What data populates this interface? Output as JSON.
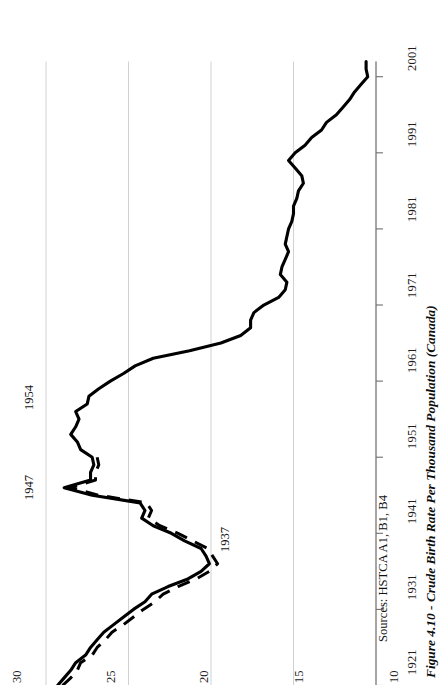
{
  "figure": {
    "caption": "Figure 4.10 - Crude Birth Rate Per Thousand Population (Canada)",
    "sources": "Sources: HSTCA A1, B1, B4"
  },
  "annotations": [
    {
      "id": "peak-1947",
      "label": "1947"
    },
    {
      "id": "peak-1954",
      "label": "1954"
    },
    {
      "id": "trough-1937",
      "label": "1937"
    }
  ],
  "axis": {
    "x_tick_labels": [
      "1921",
      "1931",
      "1941",
      "1951",
      "1961",
      "1971",
      "1981",
      "1991",
      "2001"
    ],
    "y_tick_labels": [
      "30",
      "25",
      "20",
      "15",
      "10"
    ]
  },
  "chart_data": {
    "type": "line",
    "title": "Figure 4.10 - Crude Birth Rate Per Thousand Population (Canada)",
    "xlabel": "",
    "ylabel": "",
    "xlim": [
      1921,
      2003
    ],
    "ylim": [
      10,
      30
    ],
    "grid": true,
    "legend": "none",
    "orientation": "rotated-90ccw",
    "xticks": [
      1921,
      1931,
      1941,
      1951,
      1961,
      1971,
      1981,
      1991,
      2001
    ],
    "yticks": [
      10,
      15,
      20,
      25,
      30
    ],
    "annotations": [
      {
        "label": "1947",
        "x": 1947,
        "y": 28.9
      },
      {
        "label": "1954",
        "x": 1954,
        "y": 28.5
      },
      {
        "label": "1937",
        "x": 1937,
        "y": 20.1
      }
    ],
    "series": [
      {
        "name": "Crude birth rate (solid)",
        "style": "solid",
        "x": [
          1921,
          1922,
          1923,
          1924,
          1925,
          1926,
          1927,
          1928,
          1929,
          1930,
          1931,
          1932,
          1933,
          1934,
          1935,
          1936,
          1937,
          1938,
          1939,
          1940,
          1941,
          1942,
          1943,
          1944,
          1945,
          1946,
          1947,
          1948,
          1949,
          1950,
          1951,
          1952,
          1953,
          1954,
          1955,
          1956,
          1957,
          1958,
          1959,
          1960,
          1961,
          1962,
          1963,
          1964,
          1965,
          1966,
          1967,
          1968,
          1969,
          1970,
          1971,
          1972,
          1973,
          1974,
          1975,
          1976,
          1977,
          1978,
          1979,
          1980,
          1981,
          1982,
          1983,
          1984,
          1985,
          1986,
          1987,
          1988,
          1989,
          1990,
          1991,
          1992,
          1993,
          1994,
          1995,
          1996,
          1997,
          1998,
          1999,
          2000,
          2001,
          2002,
          2003
        ],
        "y": [
          29.3,
          28.9,
          28.5,
          28.2,
          27.6,
          27.3,
          26.9,
          26.5,
          25.9,
          25.3,
          24.7,
          24.0,
          23.6,
          22.6,
          21.4,
          20.6,
          20.1,
          20.3,
          20.6,
          21.6,
          22.4,
          23.5,
          24.2,
          24.0,
          24.3,
          27.2,
          28.9,
          27.3,
          27.3,
          27.1,
          27.2,
          27.9,
          28.1,
          28.5,
          28.2,
          28.0,
          28.2,
          27.5,
          27.4,
          26.8,
          26.1,
          25.3,
          24.6,
          23.5,
          21.3,
          19.4,
          18.2,
          17.6,
          17.6,
          17.4,
          16.8,
          15.9,
          15.5,
          15.4,
          15.8,
          15.7,
          15.5,
          15.3,
          15.5,
          15.4,
          15.3,
          15.1,
          15.0,
          15.0,
          14.8,
          14.7,
          14.4,
          14.5,
          14.9,
          15.3,
          14.9,
          14.3,
          13.9,
          13.3,
          13.0,
          12.4,
          12.0,
          11.6,
          11.3,
          10.9,
          10.5,
          10.6,
          10.6
        ]
      },
      {
        "name": "Crude birth rate excluding Newfoundland (dashed)",
        "style": "dashed",
        "x": [
          1921,
          1922,
          1923,
          1924,
          1925,
          1926,
          1927,
          1928,
          1929,
          1930,
          1931,
          1932,
          1933,
          1934,
          1935,
          1936,
          1937,
          1938,
          1939,
          1940,
          1941,
          1942,
          1943,
          1944,
          1945,
          1946,
          1947,
          1948,
          1949,
          1950,
          1951
        ],
        "y": [
          29.0,
          28.5,
          28.1,
          27.9,
          27.2,
          26.9,
          26.4,
          26.0,
          25.3,
          24.7,
          24.1,
          23.4,
          22.9,
          22.0,
          20.9,
          20.1,
          19.6,
          19.9,
          20.2,
          21.1,
          22.0,
          23.1,
          23.8,
          23.6,
          23.9,
          26.8,
          28.5,
          27.0,
          27.0,
          26.8,
          26.9
        ]
      }
    ]
  }
}
